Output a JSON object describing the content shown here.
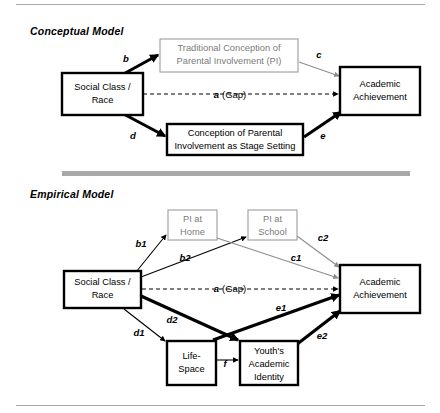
{
  "figure": {
    "sections": [
      {
        "id": "conceptual",
        "title": "Conceptual Model"
      },
      {
        "id": "empirical",
        "title": "Empirical Model"
      }
    ],
    "colors": {
      "primary_stroke": "#000000",
      "muted_stroke": "#9d9d9d",
      "muted_text": "#7b7b7b",
      "divider": "#a8a8a8",
      "rule": "#a9a9a9",
      "background": "#ffffff"
    },
    "gap_label": {
      "symbol": "a",
      "tail": "(Gap)"
    }
  },
  "conceptual_model": {
    "nodes": {
      "social_class": {
        "lines": [
          "Social Class /",
          "Race"
        ]
      },
      "traditional_pi": {
        "lines": [
          "Traditional Conception of",
          "Parental Involvement (PI)"
        ]
      },
      "stage_setting": {
        "lines": [
          "Conception of Parental",
          "Involvement as Stage Setting"
        ]
      },
      "academic_achievement": {
        "lines": [
          "Academic",
          "Achievement"
        ]
      }
    },
    "edges": [
      {
        "id": "b",
        "label": "b",
        "from": "social_class",
        "to": "traditional_pi",
        "style": "thick"
      },
      {
        "id": "c",
        "label": "c",
        "from": "traditional_pi",
        "to": "academic_achievement",
        "style": "muted"
      },
      {
        "id": "a",
        "label": "a",
        "tail": "(Gap)",
        "from": "social_class",
        "to": "academic_achievement",
        "style": "dashed"
      },
      {
        "id": "d",
        "label": "d",
        "from": "social_class",
        "to": "stage_setting",
        "style": "thick"
      },
      {
        "id": "e",
        "label": "e",
        "from": "stage_setting",
        "to": "academic_achievement",
        "style": "thick"
      }
    ]
  },
  "empirical_model": {
    "nodes": {
      "social_class": {
        "lines": [
          "Social Class /",
          "Race"
        ]
      },
      "pi_home": {
        "lines": [
          "PI at",
          "Home"
        ]
      },
      "pi_school": {
        "lines": [
          "PI at",
          "School"
        ]
      },
      "life_space": {
        "lines": [
          "Life-",
          "Space"
        ]
      },
      "academic_identity": {
        "lines": [
          "Youth's",
          "Academic",
          "Identity"
        ]
      },
      "academic_achievement": {
        "lines": [
          "Academic",
          "Achievement"
        ]
      }
    },
    "edges": [
      {
        "id": "b1",
        "label": "b1",
        "from": "social_class",
        "to": "pi_home",
        "style": "thin"
      },
      {
        "id": "b2",
        "label": "b2",
        "from": "social_class",
        "to": "pi_school",
        "style": "thin"
      },
      {
        "id": "c1",
        "label": "c1",
        "from": "pi_home",
        "to": "academic_achievement",
        "style": "muted"
      },
      {
        "id": "c2",
        "label": "c2",
        "from": "pi_school",
        "to": "academic_achievement",
        "style": "muted"
      },
      {
        "id": "a",
        "label": "a",
        "tail": "(Gap)",
        "from": "social_class",
        "to": "academic_achievement",
        "style": "dashed"
      },
      {
        "id": "d1",
        "label": "d1",
        "from": "social_class",
        "to": "life_space",
        "style": "thin"
      },
      {
        "id": "d2",
        "label": "d2",
        "from": "social_class",
        "to": "academic_identity",
        "style": "thick"
      },
      {
        "id": "e1",
        "label": "e1",
        "from": "life_space",
        "to": "academic_achievement",
        "style": "thick"
      },
      {
        "id": "e2",
        "label": "e2",
        "from": "academic_identity",
        "to": "academic_achievement",
        "style": "thick"
      },
      {
        "id": "f",
        "label": "f",
        "from": "life_space",
        "to": "academic_identity",
        "style": "thin"
      }
    ]
  }
}
